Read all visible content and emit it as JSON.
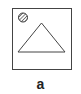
{
  "figure": {
    "label": "a",
    "shapes": [
      "square-frame",
      "hatched-circle",
      "triangle"
    ],
    "stroke_color": "#444444"
  }
}
